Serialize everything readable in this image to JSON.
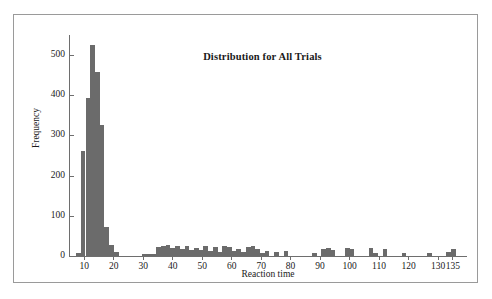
{
  "figure": {
    "title": "Distribution for All Trials",
    "xlabel": "Reaction time",
    "ylabel": "Frequency",
    "bar_color": "#6b6b6b",
    "axis_color": "#6e6e6e",
    "frame_color": "#9a9a9a",
    "background": "#ffffff"
  },
  "axes": {
    "y_ticks": [
      0,
      100,
      200,
      300,
      400,
      500
    ],
    "x_ticks": [
      10,
      20,
      30,
      40,
      50,
      60,
      70,
      80,
      90,
      100,
      110,
      120,
      130,
      135
    ],
    "y_range": [
      0,
      550
    ],
    "x_range": [
      5,
      140
    ],
    "grid": false
  },
  "chart_data": {
    "type": "bar",
    "title": "Distribution for All Trials",
    "xlabel": "Reaction time",
    "ylabel": "Frequency",
    "xlim": [
      5,
      140
    ],
    "ylim": [
      0,
      550
    ],
    "grid": false,
    "legend": null,
    "bin_width": 1.6,
    "categories": [
      8.2,
      9.8,
      11.4,
      13.0,
      14.6,
      16.2,
      17.8,
      19.4,
      21.0,
      30.6,
      32.2,
      33.8,
      35.4,
      37.0,
      38.6,
      40.2,
      41.8,
      43.4,
      45.0,
      46.6,
      48.2,
      49.8,
      51.4,
      53.0,
      54.6,
      56.2,
      57.8,
      59.4,
      61.0,
      62.6,
      64.2,
      65.8,
      67.4,
      69.0,
      70.6,
      72.2,
      75.4,
      78.6,
      88.2,
      91.4,
      93.0,
      94.6,
      99.4,
      101.0,
      107.4,
      109.0,
      112.2,
      118.6,
      127.4,
      133.8,
      135.4
    ],
    "values": [
      8,
      262,
      393,
      525,
      458,
      325,
      72,
      28,
      10,
      4,
      5,
      6,
      22,
      24,
      28,
      20,
      26,
      18,
      24,
      14,
      20,
      16,
      24,
      13,
      22,
      10,
      25,
      22,
      12,
      18,
      10,
      22,
      24,
      18,
      8,
      12,
      10,
      12,
      8,
      18,
      20,
      16,
      20,
      18,
      19,
      8,
      18,
      7,
      8,
      9,
      18
    ]
  }
}
